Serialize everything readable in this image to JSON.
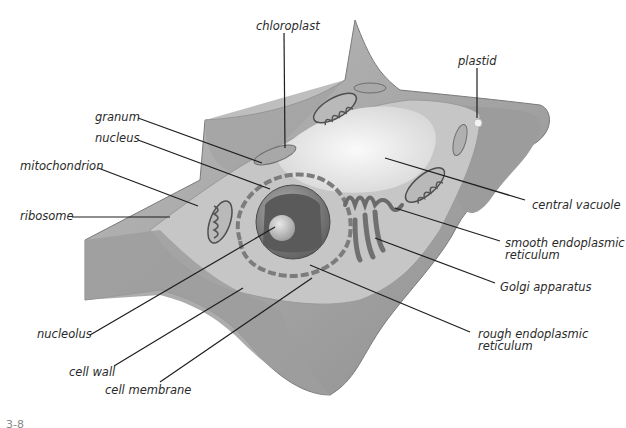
{
  "figure": {
    "number_fragment": "3-8",
    "colors": {
      "line": "#1e1e1e",
      "label_text": "#2a2a2a",
      "cell_wall": "#a9a9a9",
      "cytoplasm": "#c4c4c4",
      "vacuole": "#ededed",
      "nucleus": "#8a8a8a"
    }
  },
  "labels": {
    "chloroplast": "chloroplast",
    "plastid": "plastid",
    "granum": "granum",
    "nucleus": "nucleus",
    "mitochondrion": "mitochondrion",
    "ribosome": "ribosome",
    "central_vacuole": "central vacuole",
    "smooth_er_line1": "smooth endoplasmic",
    "smooth_er_line2": "reticulum",
    "golgi": "Golgi apparatus",
    "rough_er_line1": "rough endoplasmic",
    "rough_er_line2": "reticulum",
    "nucleolus": "nucleolus",
    "cell_wall": "cell wall",
    "cell_membrane": "cell membrane"
  }
}
